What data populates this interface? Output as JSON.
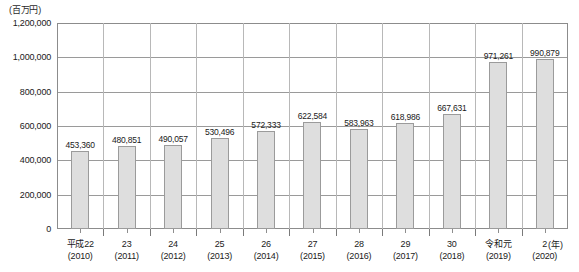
{
  "chart_data": {
    "type": "bar",
    "title": "",
    "unit_label": "(百万円)",
    "xlabel": "(年)",
    "ylabel": "",
    "ylim": [
      0,
      1200000
    ],
    "grid": true,
    "legend": "none",
    "y_ticks": [
      "0",
      "200,000",
      "400,000",
      "600,000",
      "800,000",
      "1,000,000",
      "1,200,000"
    ],
    "y_tick_values": [
      0,
      200000,
      400000,
      600000,
      800000,
      1000000,
      1200000
    ],
    "categories": [
      {
        "era": "平成22",
        "year": "(2010)"
      },
      {
        "era": "23",
        "year": "(2011)"
      },
      {
        "era": "24",
        "year": "(2012)"
      },
      {
        "era": "25",
        "year": "(2013)"
      },
      {
        "era": "26",
        "year": "(2014)"
      },
      {
        "era": "27",
        "year": "(2015)"
      },
      {
        "era": "28",
        "year": "(2016)"
      },
      {
        "era": "29",
        "year": "(2017)"
      },
      {
        "era": "30",
        "year": "(2018)"
      },
      {
        "era": "令和元",
        "year": "(2019)"
      },
      {
        "era": "2",
        "year": "(2020)"
      }
    ],
    "values": [
      453360,
      480851,
      490057,
      530496,
      572333,
      622584,
      583963,
      618986,
      667631,
      971261,
      990879
    ],
    "value_labels": [
      "453,360",
      "480,851",
      "490,057",
      "530,496",
      "572,333",
      "622,584",
      "583,963",
      "618,986",
      "667,631",
      "971,261",
      "990,879"
    ],
    "colors": {
      "bar_fill": "#dedede",
      "bar_border": "#9b9b9b",
      "gridline": "#9a9a9a",
      "frame": "#8c8c8c",
      "text": "#1a1a1a",
      "background": "#ffffff"
    }
  }
}
